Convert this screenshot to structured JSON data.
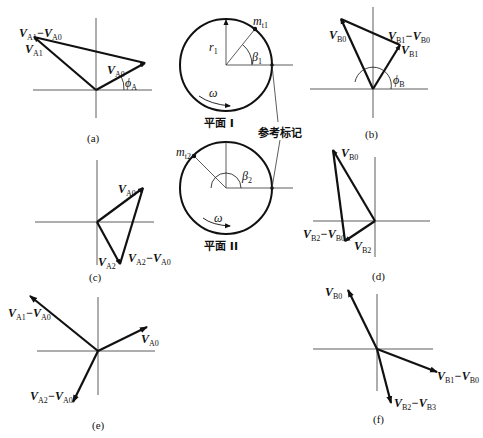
{
  "figure": {
    "panels": {
      "a": {
        "caption": "(a)",
        "labels": {
          "diff": {
            "main": "V",
            "sub1": "A1",
            "minus": "−V",
            "sub2": "A0"
          },
          "v1": {
            "main": "V",
            "sub": "A1"
          },
          "v0": {
            "main": "V",
            "sub": "A0"
          },
          "angle": {
            "main": "ϕ",
            "sub": "A"
          }
        }
      },
      "b": {
        "caption": "(b)",
        "labels": {
          "v0": {
            "main": "V",
            "sub": "B0"
          },
          "diff": {
            "main": "V",
            "sub1": "B1",
            "minus": "−V",
            "sub2": "B0"
          },
          "v1": {
            "main": "V",
            "sub": "B1"
          },
          "angle": {
            "main": "ϕ",
            "sub": "B"
          }
        }
      },
      "c": {
        "caption": "(c)",
        "labels": {
          "v0": {
            "main": "V",
            "sub": "A0"
          },
          "v2": {
            "main": "V",
            "sub": "A2"
          },
          "diff": {
            "main": "V",
            "sub1": "A2",
            "minus": "−V",
            "sub2": "A0"
          }
        }
      },
      "d": {
        "caption": "(d)",
        "labels": {
          "v0": {
            "main": "V",
            "sub": "B0"
          },
          "diff": {
            "main": "V",
            "sub1": "B2",
            "minus": "−V",
            "sub2": "B0"
          },
          "v2": {
            "main": "V",
            "sub": "B2"
          }
        }
      },
      "e": {
        "caption": "(e)",
        "labels": {
          "diff1": {
            "main": "V",
            "sub1": "A1",
            "minus": "−V",
            "sub2": "A0"
          },
          "v0": {
            "main": "V",
            "sub": "A0"
          },
          "diff2": {
            "main": "V",
            "sub1": "A2",
            "minus": "−V",
            "sub2": "A0"
          }
        }
      },
      "f": {
        "caption": "(f)",
        "labels": {
          "v0": {
            "main": "V",
            "sub": "B0"
          },
          "diff1": {
            "main": "V",
            "sub1": "B1",
            "minus": "−V",
            "sub2": "B0"
          },
          "diff2": {
            "main": "V",
            "sub1": "B2",
            "minus": "−V",
            "sub2": "B3"
          }
        }
      }
    },
    "plane1": {
      "title": "平面 I",
      "mass": {
        "main": "m",
        "sub": "t1"
      },
      "radius": {
        "main": "r",
        "sub": "1"
      },
      "angle": {
        "main": "β",
        "sub": "1"
      },
      "omega": "ω"
    },
    "plane2": {
      "title": "平面 II",
      "mass": {
        "main": "m",
        "sub": "t2"
      },
      "angle": {
        "main": "β",
        "sub": "2"
      },
      "omega": "ω"
    },
    "reference_mark": "参考标记"
  }
}
